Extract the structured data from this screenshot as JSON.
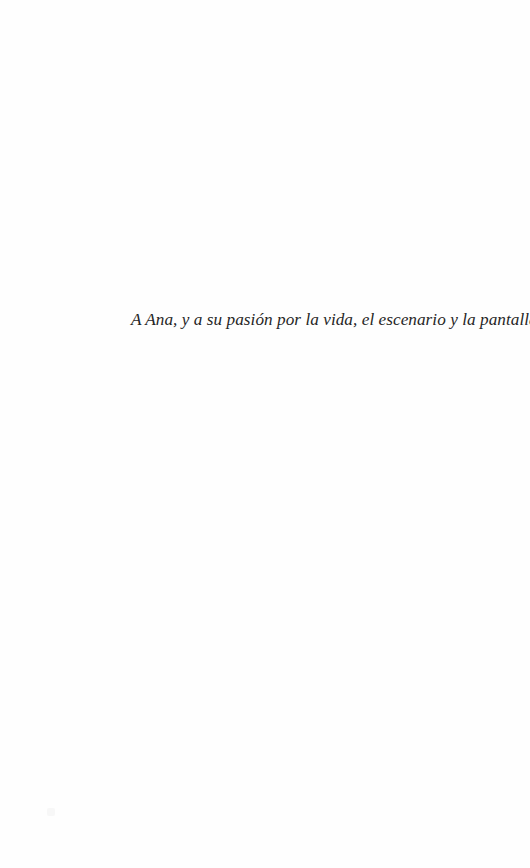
{
  "page": {
    "background": "#fefefe",
    "text_color": "#262626"
  },
  "dedication": {
    "text": "A Ana, y a su pasión por la vida, el escenario y la pantalla."
  }
}
